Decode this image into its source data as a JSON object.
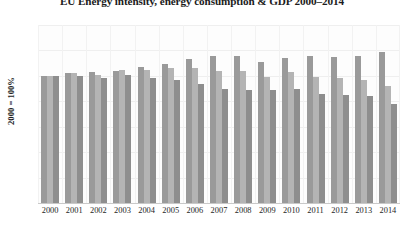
{
  "chart_data": {
    "type": "bar",
    "title": "EU Energy intensity, energy consumption & GDP 2000–2014",
    "xlabel": "",
    "ylabel": "2000 = 100%",
    "ylim": [
      0,
      140
    ],
    "yticks": [
      0,
      20,
      40,
      60,
      80,
      100,
      120,
      140
    ],
    "grid": true,
    "legend": "none",
    "categories": [
      "2000",
      "2001",
      "2002",
      "2003",
      "2004",
      "2005",
      "2006",
      "2007",
      "2008",
      "2009",
      "2010",
      "2011",
      "2012",
      "2013",
      "2014"
    ],
    "series": [
      {
        "name": "GDP",
        "color": "#9a9a9a",
        "values": [
          100,
          102,
          103,
          104,
          107,
          109,
          113,
          116,
          116,
          111,
          114,
          116,
          115,
          116,
          119
        ]
      },
      {
        "name": "Energy consumption",
        "color": "#b4b4b4",
        "values": [
          100,
          102,
          101,
          105,
          105,
          106,
          106,
          104,
          104,
          99,
          103,
          99,
          98,
          97,
          92
        ]
      },
      {
        "name": "Energy intensity",
        "color": "#8e8e8e",
        "values": [
          100,
          100,
          98,
          101,
          98,
          97,
          94,
          90,
          89,
          89,
          90,
          86,
          85,
          84,
          78
        ]
      }
    ]
  }
}
